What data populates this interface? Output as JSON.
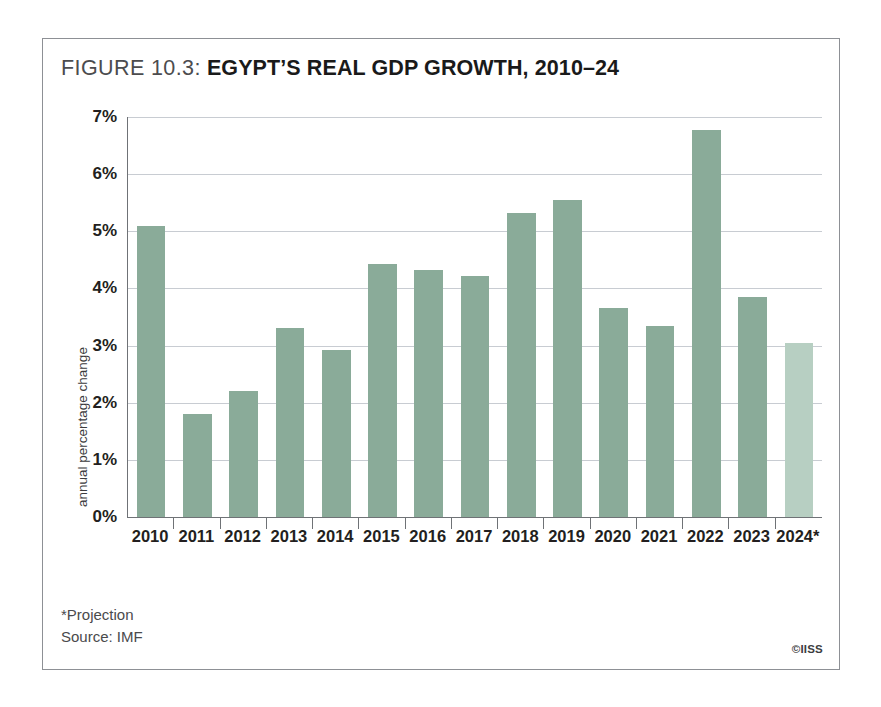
{
  "figure": {
    "label": "FIGURE 10.3:",
    "name": "EGYPT’S REAL GDP GROWTH, 2010–24"
  },
  "footnotes": {
    "projection_note": "*Projection",
    "source": "Source: IMF"
  },
  "credit": "©IISS",
  "colors": {
    "bar": "#8aab99",
    "bar_projection": "#b7cfc2",
    "gridline": "#c8ccd2",
    "axis": "#6f7276",
    "frame": "#8d9095",
    "text": "#231f20"
  },
  "chart_data": {
    "type": "bar",
    "title": "FIGURE 10.3: EGYPT’S REAL GDP GROWTH, 2010–24",
    "xlabel": "",
    "ylabel": "annual percentage change",
    "ylim": [
      0,
      7
    ],
    "ytick_labels": [
      "0%",
      "1%",
      "2%",
      "3%",
      "4%",
      "5%",
      "6%",
      "7%"
    ],
    "ytick_values": [
      0,
      1,
      2,
      3,
      4,
      5,
      6,
      7
    ],
    "grid": true,
    "legend": "none",
    "unit": "percent",
    "categories": [
      "2010",
      "2011",
      "2012",
      "2013",
      "2014",
      "2015",
      "2016",
      "2017",
      "2018",
      "2019",
      "2020",
      "2021",
      "2022",
      "2023",
      "2024*"
    ],
    "values": [
      5.1,
      1.8,
      2.2,
      3.3,
      2.93,
      4.42,
      4.32,
      4.22,
      5.32,
      5.55,
      3.65,
      3.35,
      6.77,
      3.85,
      3.05
    ],
    "projection_index": 14,
    "annotations": [
      "*Projection",
      "Source: IMF"
    ]
  }
}
